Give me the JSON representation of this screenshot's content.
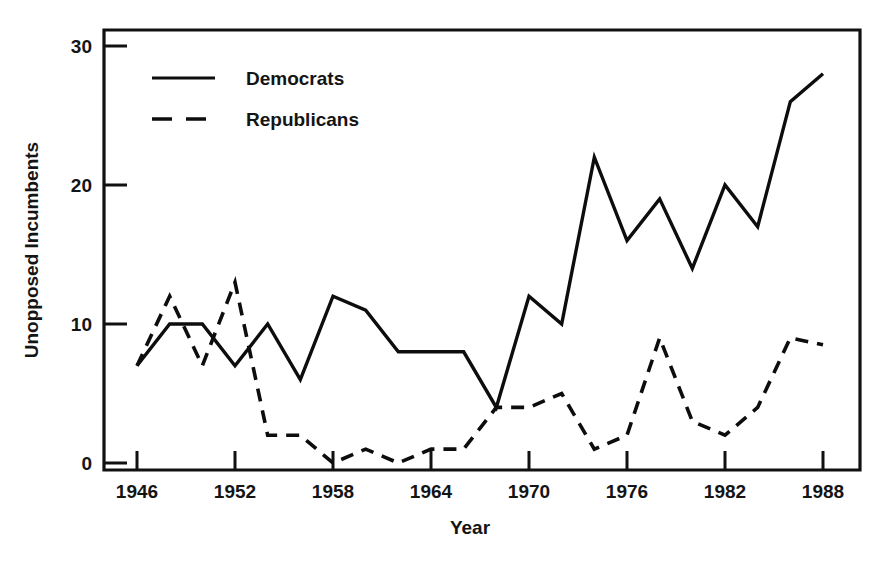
{
  "chart_data": {
    "type": "line",
    "title": "",
    "xlabel": "Year",
    "ylabel": "Unopposed Incumbents",
    "xlim": [
      1944,
      1990
    ],
    "ylim": [
      0,
      31.5
    ],
    "grid": false,
    "legend_position": "top-left-inside",
    "x": [
      1946,
      1948,
      1950,
      1952,
      1954,
      1956,
      1958,
      1960,
      1962,
      1964,
      1966,
      1968,
      1970,
      1972,
      1974,
      1976,
      1978,
      1980,
      1982,
      1984,
      1986,
      1988
    ],
    "xticks": [
      1946,
      1952,
      1958,
      1964,
      1970,
      1976,
      1982,
      1988
    ],
    "xticklabels": [
      "1946",
      "1952",
      "1958",
      "1964",
      "1970",
      "1976",
      "1982",
      "1988"
    ],
    "yticks": [
      0,
      10,
      20,
      30
    ],
    "yticklabels": [
      "0",
      "10",
      "20",
      "30"
    ],
    "series": [
      {
        "name": "Democrats",
        "style": "solid",
        "values": [
          7,
          10,
          10,
          7,
          10,
          6,
          12,
          11,
          8,
          8,
          8,
          4,
          12,
          10,
          22,
          16,
          19,
          14,
          20,
          17,
          26,
          28
        ]
      },
      {
        "name": "Republicans",
        "style": "dashed",
        "values": [
          7,
          12,
          7,
          13,
          2,
          2,
          0,
          1,
          0,
          1,
          1,
          4,
          4,
          5,
          1,
          2,
          9,
          3,
          2,
          4,
          9,
          8.5
        ]
      }
    ]
  },
  "legend": {
    "entries": [
      {
        "label": "Democrats",
        "style": "solid"
      },
      {
        "label": "Republicans",
        "style": "dashed"
      }
    ]
  },
  "axes": {
    "x_title": "Year",
    "y_title": "Unopposed Incumbents"
  },
  "colors": {
    "ink": "#0d0d0d",
    "background": "#ffffff"
  }
}
